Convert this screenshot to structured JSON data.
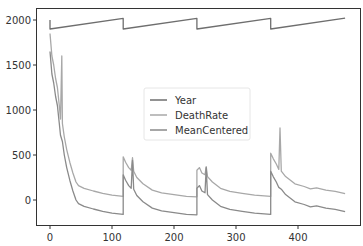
{
  "chart_data": {
    "type": "line",
    "title": "",
    "xlabel": "",
    "ylabel": "",
    "xlim": [
      -24,
      500
    ],
    "ylim": [
      -300,
      2150
    ],
    "grid": false,
    "legend_position": "center",
    "x_ticks": [
      0,
      100,
      200,
      300,
      400
    ],
    "y_ticks": [
      0,
      500,
      1000,
      1500,
      2000
    ],
    "series": [
      {
        "name": "Year",
        "color": "#6e6e6e",
        "points": [
          [
            0,
            2000
          ],
          [
            0,
            1900
          ],
          [
            118,
            2018
          ],
          [
            118,
            1900
          ],
          [
            237,
            2018
          ],
          [
            237,
            1900
          ],
          [
            356,
            2018
          ],
          [
            356,
            1900
          ],
          [
            476,
            2020
          ]
        ]
      },
      {
        "name": "DeathRate",
        "color": "#a8a8a8",
        "points": [
          [
            0,
            1850
          ],
          [
            3,
            1600
          ],
          [
            6,
            1500
          ],
          [
            9,
            1350
          ],
          [
            12,
            1250
          ],
          [
            15,
            1050
          ],
          [
            17,
            900
          ],
          [
            19,
            1600
          ],
          [
            20,
            850
          ],
          [
            23,
            700
          ],
          [
            27,
            560
          ],
          [
            32,
            420
          ],
          [
            37,
            300
          ],
          [
            42,
            200
          ],
          [
            46,
            160
          ],
          [
            55,
            130
          ],
          [
            70,
            100
          ],
          [
            85,
            75
          ],
          [
            100,
            55
          ],
          [
            118,
            40
          ],
          [
            118,
            480
          ],
          [
            122,
            420
          ],
          [
            127,
            360
          ],
          [
            131,
            330
          ],
          [
            133,
            470
          ],
          [
            135,
            320
          ],
          [
            140,
            250
          ],
          [
            150,
            180
          ],
          [
            165,
            110
          ],
          [
            180,
            80
          ],
          [
            200,
            60
          ],
          [
            220,
            40
          ],
          [
            237,
            35
          ],
          [
            237,
            330
          ],
          [
            241,
            360
          ],
          [
            245,
            300
          ],
          [
            250,
            280
          ],
          [
            252,
            370
          ],
          [
            254,
            260
          ],
          [
            262,
            200
          ],
          [
            275,
            130
          ],
          [
            290,
            95
          ],
          [
            310,
            75
          ],
          [
            330,
            55
          ],
          [
            356,
            40
          ],
          [
            356,
            520
          ],
          [
            360,
            460
          ],
          [
            365,
            400
          ],
          [
            369,
            340
          ],
          [
            371,
            800
          ],
          [
            373,
            320
          ],
          [
            380,
            260
          ],
          [
            395,
            180
          ],
          [
            410,
            150
          ],
          [
            420,
            125
          ],
          [
            430,
            135
          ],
          [
            445,
            110
          ],
          [
            460,
            95
          ],
          [
            476,
            70
          ]
        ]
      },
      {
        "name": "MeanCentered",
        "color": "#8a8a8a",
        "points": [
          [
            0,
            1650
          ],
          [
            3,
            1400
          ],
          [
            6,
            1300
          ],
          [
            9,
            1150
          ],
          [
            12,
            1050
          ],
          [
            15,
            850
          ],
          [
            17,
            720
          ],
          [
            20,
            650
          ],
          [
            23,
            500
          ],
          [
            27,
            360
          ],
          [
            32,
            220
          ],
          [
            37,
            100
          ],
          [
            42,
            0
          ],
          [
            46,
            -40
          ],
          [
            55,
            -70
          ],
          [
            70,
            -100
          ],
          [
            85,
            -125
          ],
          [
            100,
            -145
          ],
          [
            118,
            -160
          ],
          [
            118,
            280
          ],
          [
            122,
            220
          ],
          [
            127,
            160
          ],
          [
            131,
            130
          ],
          [
            133,
            440
          ],
          [
            135,
            120
          ],
          [
            140,
            50
          ],
          [
            150,
            -20
          ],
          [
            165,
            -90
          ],
          [
            180,
            -120
          ],
          [
            200,
            -140
          ],
          [
            220,
            -160
          ],
          [
            237,
            -165
          ],
          [
            237,
            130
          ],
          [
            241,
            160
          ],
          [
            245,
            100
          ],
          [
            250,
            80
          ],
          [
            252,
            360
          ],
          [
            254,
            60
          ],
          [
            262,
            0
          ],
          [
            275,
            -70
          ],
          [
            290,
            -105
          ],
          [
            310,
            -125
          ],
          [
            330,
            -145
          ],
          [
            356,
            -160
          ],
          [
            356,
            320
          ],
          [
            360,
            260
          ],
          [
            365,
            200
          ],
          [
            369,
            140
          ],
          [
            373,
            120
          ],
          [
            380,
            60
          ],
          [
            395,
            -20
          ],
          [
            410,
            -50
          ],
          [
            420,
            -75
          ],
          [
            430,
            -65
          ],
          [
            445,
            -90
          ],
          [
            460,
            -105
          ],
          [
            476,
            -130
          ]
        ]
      }
    ]
  }
}
